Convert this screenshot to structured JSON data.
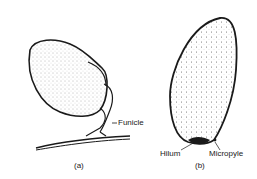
{
  "figure": {
    "panels": [
      {
        "id": "a",
        "caption": "(a)",
        "labels": [
          {
            "text": "Funicle"
          }
        ]
      },
      {
        "id": "b",
        "caption": "(b)",
        "labels": [
          {
            "text": "Hilum"
          },
          {
            "text": "Micropyle"
          }
        ]
      }
    ],
    "colors": {
      "ink": "#1a1a1a",
      "stipple": "#555555",
      "background": "#ffffff"
    }
  }
}
